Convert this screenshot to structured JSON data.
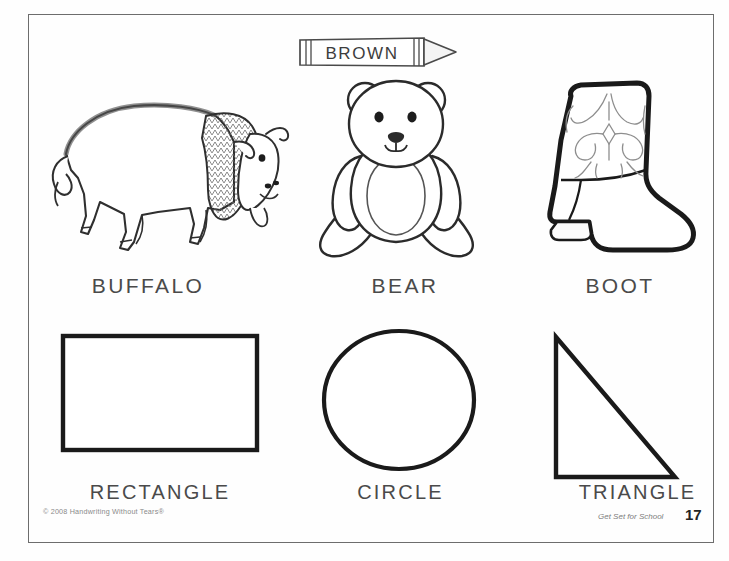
{
  "page": {
    "background_color": "#ffffff",
    "border_color": "#6d6d6d"
  },
  "crayon": {
    "label": "BROWN",
    "icon": "crayon-icon",
    "color": "#3d3d3d"
  },
  "picture_row": {
    "items": [
      {
        "label": "BUFFALO",
        "icon": "buffalo-icon"
      },
      {
        "label": "BEAR",
        "icon": "teddy-bear-icon"
      },
      {
        "label": "BOOT",
        "icon": "cowboy-boot-icon"
      }
    ]
  },
  "shape_row": {
    "items": [
      {
        "label": "RECTANGLE",
        "icon": "rectangle-shape-icon"
      },
      {
        "label": "CIRCLE",
        "icon": "circle-shape-icon"
      },
      {
        "label": "TRIANGLE",
        "icon": "triangle-shape-icon"
      }
    ]
  },
  "footer": {
    "copyright": "© 2008 Handwriting Without Tears®",
    "series": "Get Set for School",
    "page_number": "17"
  }
}
